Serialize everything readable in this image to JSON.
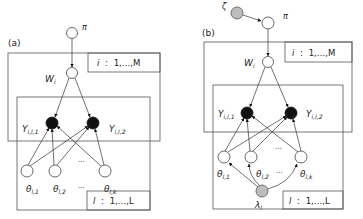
{
  "panels": [
    {
      "label": "(a)",
      "nodes": {
        "pi": {
          "symbol": "π",
          "type": "latent"
        },
        "w": {
          "symbol": "W",
          "sub": "i",
          "type": "latent"
        },
        "y1": {
          "symbol": "Y",
          "sub": "i,l,1",
          "type": "observed"
        },
        "y2": {
          "symbol": "Y",
          "sub": "i,l,2",
          "type": "observed"
        },
        "theta1": {
          "symbol": "θ",
          "sub": "l,1",
          "type": "latent"
        },
        "theta2": {
          "symbol": "θ",
          "sub": "l,2",
          "type": "latent"
        },
        "thetak": {
          "symbol": "θ",
          "sub": "l,k",
          "type": "latent"
        }
      },
      "ellipsis": "···",
      "plates": {
        "outer": {
          "index": "i",
          "sep": ":",
          "range": "1,…,M"
        },
        "inner": {
          "index": "l",
          "sep": ":",
          "range": "1,…,L"
        }
      }
    },
    {
      "label": "(b)",
      "nodes": {
        "zeta": {
          "symbol": "ζ",
          "type": "hyperparameter"
        },
        "pi": {
          "symbol": "π",
          "type": "latent"
        },
        "w": {
          "symbol": "W",
          "sub": "i",
          "type": "latent"
        },
        "y1": {
          "symbol": "Y",
          "sub": "i,l,1",
          "type": "observed"
        },
        "y2": {
          "symbol": "Y",
          "sub": "i,l,2",
          "type": "observed"
        },
        "theta1": {
          "symbol": "θ",
          "sub": "l,1",
          "type": "latent"
        },
        "theta2": {
          "symbol": "θ",
          "sub": "l,2",
          "type": "latent"
        },
        "thetak": {
          "symbol": "θ",
          "sub": "l,k",
          "type": "latent"
        },
        "lambda": {
          "symbol": "λ",
          "sub": "l",
          "type": "hyperparameter"
        }
      },
      "ellipsis": "···",
      "plates": {
        "outer": {
          "index": "i",
          "sep": ":",
          "range": "1,…,M"
        },
        "inner": {
          "index": "l",
          "sep": ":",
          "range": "1,…,L"
        }
      }
    }
  ],
  "colors": {
    "observed": "#111111",
    "hyperparameter": "#bdbdbd",
    "latent": "#ffffff",
    "line": "#444444"
  }
}
